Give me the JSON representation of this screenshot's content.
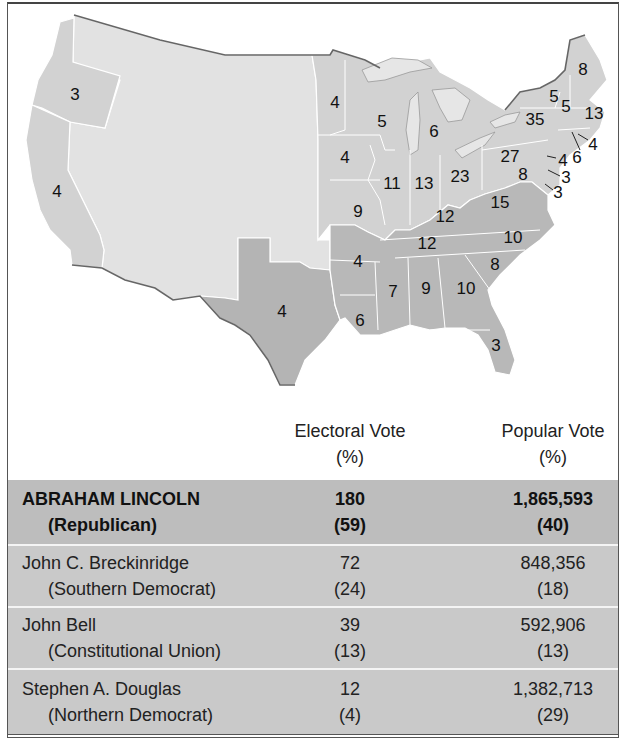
{
  "colors": {
    "republican_states": "#d2d2d2",
    "southern_democrat_states": "#b4b4b4",
    "territories": "#e2e2e2",
    "lakes": "#e6e6e6",
    "table_lincoln_row": "#bdbdbd",
    "table_other_rows": "#c9c9c9"
  },
  "map": {
    "electoral_labels": [
      {
        "state": "Oregon",
        "value": "3",
        "x": 75,
        "y": 95
      },
      {
        "state": "California",
        "value": "4",
        "x": 57,
        "y": 192
      },
      {
        "state": "Texas",
        "value": "4",
        "x": 282,
        "y": 312
      },
      {
        "state": "Minnesota",
        "value": "4",
        "x": 335,
        "y": 103
      },
      {
        "state": "Wisconsin",
        "value": "5",
        "x": 382,
        "y": 122
      },
      {
        "state": "Michigan",
        "value": "6",
        "x": 434,
        "y": 132
      },
      {
        "state": "Iowa",
        "value": "4",
        "x": 345,
        "y": 158
      },
      {
        "state": "Illinois",
        "value": "11",
        "x": 392,
        "y": 184
      },
      {
        "state": "Indiana",
        "value": "13",
        "x": 424,
        "y": 184
      },
      {
        "state": "Ohio",
        "value": "23",
        "x": 460,
        "y": 177
      },
      {
        "state": "Pennsylvania",
        "value": "27",
        "x": 510,
        "y": 157
      },
      {
        "state": "New York",
        "value": "35",
        "x": 535,
        "y": 120
      },
      {
        "state": "Vermont",
        "value": "5",
        "x": 554,
        "y": 97
      },
      {
        "state": "New Hampshire",
        "value": "5",
        "x": 566,
        "y": 107
      },
      {
        "state": "Maine",
        "value": "8",
        "x": 583,
        "y": 70
      },
      {
        "state": "Massachusetts",
        "value": "13",
        "x": 594,
        "y": 114
      },
      {
        "state": "Rhode Island",
        "value": "4",
        "x": 593,
        "y": 145
      },
      {
        "state": "Connecticut",
        "value": "6",
        "x": 577,
        "y": 158
      },
      {
        "state": "New Jersey",
        "value": "4",
        "x": 563,
        "y": 161
      },
      {
        "state": "Delaware",
        "value": "3",
        "x": 566,
        "y": 178
      },
      {
        "state": "Maryland",
        "value": "8",
        "x": 523,
        "y": 175
      },
      {
        "state": "Maryland-DC",
        "value": "3",
        "x": 558,
        "y": 193
      },
      {
        "state": "Missouri",
        "value": "9",
        "x": 358,
        "y": 212
      },
      {
        "state": "Kentucky",
        "value": "12",
        "x": 445,
        "y": 217
      },
      {
        "state": "Virginia",
        "value": "15",
        "x": 500,
        "y": 203
      },
      {
        "state": "Tennessee",
        "value": "12",
        "x": 427,
        "y": 244
      },
      {
        "state": "North Carolina",
        "value": "10",
        "x": 513,
        "y": 238
      },
      {
        "state": "Arkansas",
        "value": "4",
        "x": 358,
        "y": 262
      },
      {
        "state": "South Carolina",
        "value": "8",
        "x": 495,
        "y": 265
      },
      {
        "state": "Mississippi",
        "value": "7",
        "x": 393,
        "y": 292
      },
      {
        "state": "Alabama",
        "value": "9",
        "x": 426,
        "y": 289
      },
      {
        "state": "Georgia",
        "value": "10",
        "x": 466,
        "y": 289
      },
      {
        "state": "Louisiana",
        "value": "6",
        "x": 360,
        "y": 321
      },
      {
        "state": "Florida",
        "value": "3",
        "x": 496,
        "y": 346
      }
    ]
  },
  "table": {
    "headers": {
      "electoral_line1": "Electoral Vote",
      "electoral_line2": "(%)",
      "popular_line1": "Popular Vote",
      "popular_line2": "(%)"
    },
    "rows": [
      {
        "name": "ABRAHAM LINCOLN",
        "party": "(Republican)",
        "electoral": "180",
        "electoral_pct": "(59)",
        "popular": "1,865,593",
        "popular_pct": "(40)"
      },
      {
        "name": "John C. Breckinridge",
        "party": "(Southern Democrat)",
        "electoral": "72",
        "electoral_pct": "(24)",
        "popular": "848,356",
        "popular_pct": "(18)"
      },
      {
        "name": "John Bell",
        "party": "(Constitutional Union)",
        "electoral": "39",
        "electoral_pct": "(13)",
        "popular": "592,906",
        "popular_pct": "(13)"
      },
      {
        "name": "Stephen A. Douglas",
        "party": "(Northern Democrat)",
        "electoral": "12",
        "electoral_pct": "(4)",
        "popular": "1,382,713",
        "popular_pct": "(29)"
      }
    ]
  }
}
